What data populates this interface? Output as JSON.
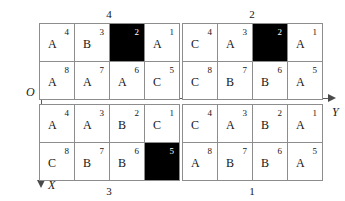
{
  "figure": {
    "axes": {
      "origin_label": "O",
      "y_axis_label": "Y",
      "x_axis_label": "X",
      "y_axis_direction": "right",
      "x_axis_direction": "down",
      "line_color": "#5a5a5a"
    },
    "colors": {
      "cell_background": "#ffffff",
      "filled_cell_background": "#000000",
      "grid_line": "#8d8d8d",
      "text": "#151515",
      "filled_cell_text": "#ffffff"
    },
    "blocks": [
      {
        "position": "top-left",
        "caption": "4",
        "cells": [
          {
            "letter": "A",
            "index": "4",
            "filled": false
          },
          {
            "letter": "B",
            "index": "3",
            "filled": false
          },
          {
            "letter": "",
            "index": "2",
            "filled": true
          },
          {
            "letter": "A",
            "index": "1",
            "filled": false
          },
          {
            "letter": "A",
            "index": "8",
            "filled": false
          },
          {
            "letter": "A",
            "index": "7",
            "filled": false
          },
          {
            "letter": "A",
            "index": "6",
            "filled": false
          },
          {
            "letter": "C",
            "index": "5",
            "filled": false
          }
        ]
      },
      {
        "position": "top-right",
        "caption": "2",
        "cells": [
          {
            "letter": "C",
            "index": "4",
            "filled": false
          },
          {
            "letter": "A",
            "index": "3",
            "filled": false
          },
          {
            "letter": "",
            "index": "2",
            "filled": true
          },
          {
            "letter": "A",
            "index": "1",
            "filled": false
          },
          {
            "letter": "C",
            "index": "8",
            "filled": false
          },
          {
            "letter": "B",
            "index": "7",
            "filled": false
          },
          {
            "letter": "B",
            "index": "6",
            "filled": false
          },
          {
            "letter": "A",
            "index": "5",
            "filled": false
          }
        ]
      },
      {
        "position": "bottom-left",
        "caption": "3",
        "cells": [
          {
            "letter": "A",
            "index": "4",
            "filled": false
          },
          {
            "letter": "A",
            "index": "3",
            "filled": false
          },
          {
            "letter": "B",
            "index": "2",
            "filled": false
          },
          {
            "letter": "C",
            "index": "1",
            "filled": false
          },
          {
            "letter": "C",
            "index": "8",
            "filled": false
          },
          {
            "letter": "B",
            "index": "7",
            "filled": false
          },
          {
            "letter": "B",
            "index": "6",
            "filled": false
          },
          {
            "letter": "",
            "index": "5",
            "filled": true
          }
        ]
      },
      {
        "position": "bottom-right",
        "caption": "1",
        "cells": [
          {
            "letter": "C",
            "index": "4",
            "filled": false
          },
          {
            "letter": "A",
            "index": "3",
            "filled": false
          },
          {
            "letter": "B",
            "index": "2",
            "filled": false
          },
          {
            "letter": "A",
            "index": "1",
            "filled": false
          },
          {
            "letter": "A",
            "index": "8",
            "filled": false
          },
          {
            "letter": "B",
            "index": "7",
            "filled": false
          },
          {
            "letter": "B",
            "index": "6",
            "filled": false
          },
          {
            "letter": "A",
            "index": "5",
            "filled": false
          }
        ]
      }
    ]
  }
}
